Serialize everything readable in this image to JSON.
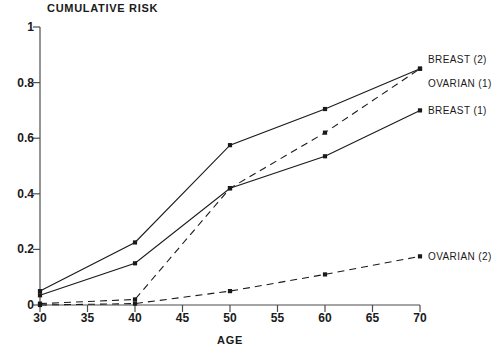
{
  "chart_data": {
    "type": "line",
    "title": "CUMULATIVE RISK",
    "xlabel": "AGE",
    "ylabel": "",
    "xlim": [
      30,
      70
    ],
    "ylim": [
      0,
      1
    ],
    "grid": false,
    "legend_position": "right-inline-annotations",
    "x": [
      30,
      40,
      50,
      60,
      70
    ],
    "xticks": [
      "30",
      "35",
      "40",
      "45",
      "50",
      "55",
      "60",
      "65",
      "70"
    ],
    "xtick_values": [
      30,
      35,
      40,
      45,
      50,
      55,
      60,
      65,
      70
    ],
    "yticks": [
      "0",
      "0.2",
      "0.4",
      "0.6",
      "0.8",
      "1"
    ],
    "ytick_values": [
      0,
      0.2,
      0.4,
      0.6,
      0.8,
      1
    ],
    "series": [
      {
        "name": "BREAST (2)",
        "linestyle": "solid",
        "marker": "square",
        "color": "#1a1a1a",
        "values": [
          0.05,
          0.225,
          0.575,
          0.705,
          0.85
        ]
      },
      {
        "name": "OVARIAN (1)",
        "linestyle": "dashed",
        "marker": "square",
        "color": "#1a1a1a",
        "values": [
          0.005,
          0.02,
          0.42,
          0.62,
          0.85
        ]
      },
      {
        "name": "BREAST (1)",
        "linestyle": "solid",
        "marker": "square",
        "color": "#1a1a1a",
        "values": [
          0.035,
          0.15,
          0.42,
          0.535,
          0.7
        ]
      },
      {
        "name": "OVARIAN (2)",
        "linestyle": "dashed",
        "marker": "square",
        "color": "#1a1a1a",
        "values": [
          0.0,
          0.005,
          0.05,
          0.11,
          0.175
        ]
      }
    ],
    "annotations": [
      {
        "text": "BREAST (2)",
        "x": 70,
        "y": 0.885
      },
      {
        "text": "OVARIAN (1)",
        "x": 70,
        "y": 0.8
      },
      {
        "text": "BREAST (1)",
        "x": 70,
        "y": 0.7
      },
      {
        "text": "OVARIAN (2)",
        "x": 70,
        "y": 0.175
      }
    ]
  }
}
